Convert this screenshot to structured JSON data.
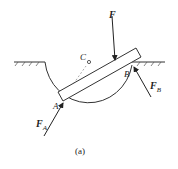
{
  "diagram": {
    "caption": "(a)",
    "labels": {
      "force_F": "F",
      "force_FA": "F",
      "force_FA_sub": "A",
      "force_FB": "F",
      "force_FB_sub": "B",
      "point_A": "A",
      "point_B": "B",
      "point_C": "C"
    },
    "colors": {
      "stroke": "#333333",
      "dashed": "#888888"
    }
  }
}
